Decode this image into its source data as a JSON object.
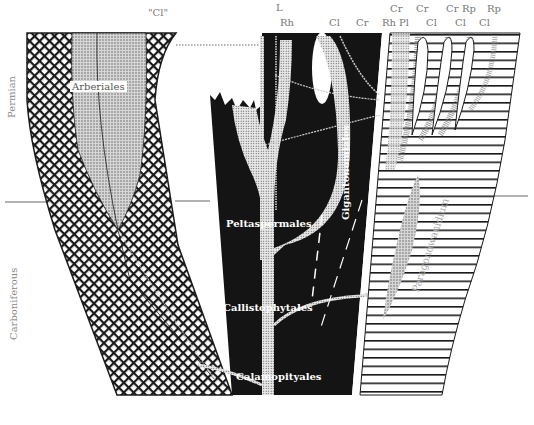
{
  "periods": {
    "upper": "Permian",
    "lower": "Carboniferous"
  },
  "top_labels": [
    {
      "text": "\"Cl\"",
      "x": 150,
      "y": 5
    },
    {
      "text": "L",
      "x": 276,
      "y": 4
    },
    {
      "text": "Rh",
      "x": 282,
      "y": 18
    },
    {
      "text": "Cl",
      "x": 330,
      "y": 18
    },
    {
      "text": "Cr",
      "x": 358,
      "y": 18
    },
    {
      "text": "Rh",
      "x": 383,
      "y": 18
    },
    {
      "text": "Pl",
      "x": 398,
      "y": 18
    },
    {
      "text": "Cr",
      "x": 392,
      "y": 4
    },
    {
      "text": "Cr",
      "x": 418,
      "y": 4
    },
    {
      "text": "Cl",
      "x": 425,
      "y": 18
    },
    {
      "text": "Cr",
      "x": 447,
      "y": 4
    },
    {
      "text": "Rp",
      "x": 463,
      "y": 4
    },
    {
      "text": "Cl",
      "x": 454,
      "y": 18
    },
    {
      "text": "Rp",
      "x": 488,
      "y": 4
    },
    {
      "text": "Cl",
      "x": 478,
      "y": 18
    }
  ],
  "groups": {
    "arberiales": "Arberiales",
    "peltaspermales": "Peltaspermales",
    "gigantonomiales": "Gigantonomiales",
    "callistophytales": "Callistophytales",
    "calamopityales": "Calamopityales",
    "paragondwanidium": "Paragondwanidium"
  },
  "colors": {
    "ink": "#1a1a1a",
    "stipple": "#bdbdbd",
    "label_grey": "#777777"
  }
}
